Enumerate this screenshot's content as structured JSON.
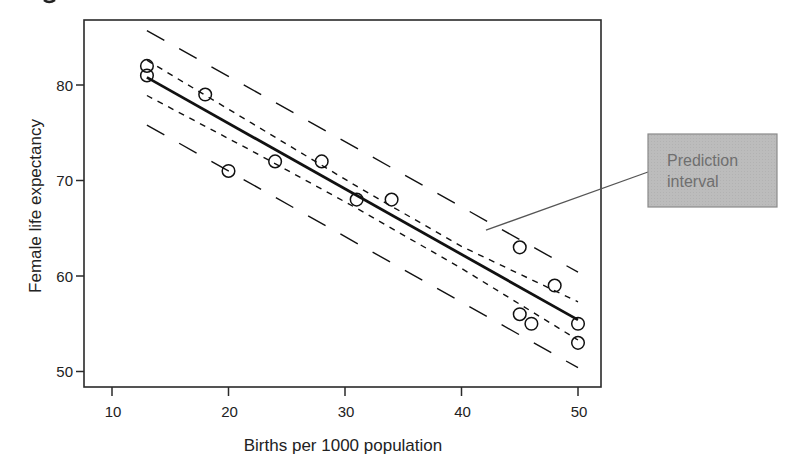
{
  "chart_data": {
    "type": "scatter",
    "title": "",
    "xlabel": "Births per 1000 population",
    "ylabel": "Female life expectancy",
    "xlim": [
      7,
      52.5
    ],
    "ylim": [
      48.2,
      86.8
    ],
    "xticks": [
      10,
      20,
      30,
      40,
      50
    ],
    "yticks": [
      50,
      60,
      70,
      80
    ],
    "grid": false,
    "legend": null,
    "series": [
      {
        "name": "Countries",
        "kind": "scatter",
        "marker": "open-circle",
        "points": [
          {
            "x": 13,
            "y": 82
          },
          {
            "x": 13,
            "y": 81
          },
          {
            "x": 18,
            "y": 79
          },
          {
            "x": 20,
            "y": 71
          },
          {
            "x": 24,
            "y": 72
          },
          {
            "x": 28,
            "y": 72
          },
          {
            "x": 31,
            "y": 68
          },
          {
            "x": 34,
            "y": 68
          },
          {
            "x": 45,
            "y": 63
          },
          {
            "x": 48,
            "y": 59
          },
          {
            "x": 45,
            "y": 56
          },
          {
            "x": 46,
            "y": 55
          },
          {
            "x": 50,
            "y": 55
          },
          {
            "x": 50,
            "y": 53
          }
        ]
      },
      {
        "name": "Regression line",
        "kind": "line",
        "style": "solid",
        "x": [
          13,
          50
        ],
        "y": [
          80.8,
          55.4
        ]
      },
      {
        "name": "Confidence interval (upper)",
        "kind": "line",
        "style": "short-dash",
        "x": [
          13,
          22,
          31,
          40,
          50
        ],
        "y": [
          82.6,
          76.0,
          69.4,
          63.1,
          57.3
        ]
      },
      {
        "name": "Confidence interval (lower)",
        "kind": "line",
        "style": "short-dash",
        "x": [
          13,
          22,
          31,
          40,
          50
        ],
        "y": [
          78.9,
          73.1,
          67.1,
          60.8,
          53.3
        ]
      },
      {
        "name": "Prediction interval (upper)",
        "kind": "line",
        "style": "long-dash",
        "x": [
          13,
          50
        ],
        "y": [
          85.7,
          60.4
        ]
      },
      {
        "name": "Prediction interval (lower)",
        "kind": "line",
        "style": "long-dash",
        "x": [
          13,
          50
        ],
        "y": [
          75.8,
          50.4
        ]
      }
    ],
    "annotations": [
      {
        "text_lines": [
          "Prediction",
          "interval"
        ],
        "points_to": {
          "x": 42.1,
          "y": 64.8
        },
        "box_fill": "#b9b9b9",
        "box_border": "#8a8a8a",
        "text_color": "#6f6f6f"
      }
    ]
  },
  "colors": {
    "axis": "#2a2a2a",
    "series": "#111111",
    "annotation_line": "#555555"
  },
  "layout": {
    "plot_left": 84,
    "plot_top": 20,
    "plot_right": 601,
    "plot_bottom": 387,
    "x_px_per_unit": 11.65,
    "x_origin_value": 10,
    "x_origin_px": 112,
    "y_px_per_unit": 9.55,
    "y_origin_value": 80,
    "y_origin_px": 85,
    "annotation_box": {
      "x": 648,
      "y": 134,
      "w": 129,
      "h": 73
    }
  }
}
